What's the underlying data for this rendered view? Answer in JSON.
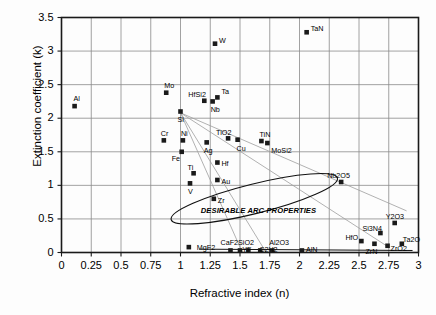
{
  "chart_data": {
    "type": "scatter",
    "title": "",
    "xlabel": "Refractive index (n)",
    "ylabel": "Extinction coefficient (k)",
    "xlim": [
      0,
      3
    ],
    "ylim": [
      0,
      3.5
    ],
    "xticks": [
      "0",
      "0.25",
      "0.5",
      "0.75",
      "1",
      "1.25",
      "1.5",
      "1.75",
      "2",
      "2.25",
      "2.5",
      "2.75",
      "3"
    ],
    "xtick_values": [
      0,
      0.25,
      0.5,
      0.75,
      1,
      1.25,
      1.5,
      1.75,
      2,
      2.25,
      2.5,
      2.75,
      3
    ],
    "yticks": [
      "0",
      "0.5",
      "1",
      "1.5",
      "2",
      "2.5",
      "3",
      "3.5"
    ],
    "ytick_values": [
      0,
      0.5,
      1,
      1.5,
      2,
      2.5,
      3,
      3.5
    ],
    "grid": true,
    "legend": null,
    "marker": "square",
    "marker_color": "#1a1a1a",
    "points": [
      {
        "label": "Al",
        "x": 0.11,
        "y": 2.18,
        "lx": -1,
        "ly": -11
      },
      {
        "label": "Mo",
        "x": 0.88,
        "y": 2.38,
        "lx": -2,
        "ly": -11
      },
      {
        "label": "Si",
        "x": 1.0,
        "y": 2.1,
        "lx": -3,
        "ly": 4
      },
      {
        "label": "HfSi2",
        "x": 1.2,
        "y": 2.26,
        "lx": -16,
        "ly": -10
      },
      {
        "label": "Ta",
        "x": 1.31,
        "y": 2.31,
        "lx": 4,
        "ly": -9
      },
      {
        "label": "Nb",
        "x": 1.27,
        "y": 2.25,
        "lx": -2,
        "ly": 5
      },
      {
        "label": "W",
        "x": 1.29,
        "y": 3.11,
        "lx": 4,
        "ly": -7
      },
      {
        "label": "TaN",
        "x": 2.06,
        "y": 3.28,
        "lx": 4,
        "ly": -7
      },
      {
        "label": "Cr",
        "x": 0.86,
        "y": 1.67,
        "lx": -3,
        "ly": -10
      },
      {
        "label": "Ni",
        "x": 1.02,
        "y": 1.67,
        "lx": -2,
        "ly": -10
      },
      {
        "label": "Ag",
        "x": 1.22,
        "y": 1.64,
        "lx": -3,
        "ly": 5
      },
      {
        "label": "TiO2",
        "x": 1.4,
        "y": 1.7,
        "lx": -12,
        "ly": -9
      },
      {
        "label": "Cu",
        "x": 1.48,
        "y": 1.68,
        "lx": -1,
        "ly": 5
      },
      {
        "label": "TiN",
        "x": 1.68,
        "y": 1.66,
        "lx": -2,
        "ly": -10
      },
      {
        "label": "MoSi2",
        "x": 1.73,
        "y": 1.63,
        "lx": 4,
        "ly": 4
      },
      {
        "label": "Fe",
        "x": 1.01,
        "y": 1.5,
        "lx": -10,
        "ly": 3
      },
      {
        "label": "Hf",
        "x": 1.31,
        "y": 1.34,
        "lx": 4,
        "ly": -3
      },
      {
        "label": "Ti",
        "x": 1.11,
        "y": 1.18,
        "lx": -6,
        "ly": -9
      },
      {
        "label": "Au",
        "x": 1.31,
        "y": 1.08,
        "lx": 4,
        "ly": -2
      },
      {
        "label": "V",
        "x": 1.08,
        "y": 1.03,
        "lx": -2,
        "ly": 5
      },
      {
        "label": "Zr",
        "x": 1.28,
        "y": 0.8,
        "lx": 4,
        "ly": -2
      },
      {
        "label": "Nb2O5",
        "x": 2.35,
        "y": 1.05,
        "lx": -14,
        "ly": -10
      },
      {
        "label": "Y2O3",
        "x": 2.8,
        "y": 0.44,
        "lx": -9,
        "ly": -10
      },
      {
        "label": "Si3N4",
        "x": 2.68,
        "y": 0.29,
        "lx": -18,
        "ly": -8
      },
      {
        "label": "HfO",
        "x": 2.52,
        "y": 0.17,
        "lx": -16,
        "ly": -7
      },
      {
        "label": "ZrN",
        "x": 2.63,
        "y": 0.13,
        "lx": -9,
        "ly": 4
      },
      {
        "label": "ZrO2",
        "x": 2.74,
        "y": 0.1,
        "lx": 3,
        "ly": -1
      },
      {
        "label": "Ta2O",
        "x": 2.86,
        "y": 0.13,
        "lx": 1,
        "ly": -8
      },
      {
        "label": "MgF2",
        "x": 1.07,
        "y": 0.08,
        "lx": 8,
        "ly": -3
      },
      {
        "label": "CaF2",
        "x": 1.42,
        "y": 0.03,
        "lx": -10,
        "ly": -11
      },
      {
        "label": "SiO2",
        "x": 1.5,
        "y": 0.03,
        "lx": -2,
        "ly": -11
      },
      {
        "label": "YF",
        "x": 1.57,
        "y": 0.03,
        "lx": -6,
        "ly": -4
      },
      {
        "label": "C2H2",
        "x": 1.67,
        "y": 0.03,
        "lx": -1,
        "ly": -4
      },
      {
        "label": "Al2O3",
        "x": 1.77,
        "y": 0.03,
        "lx": -3,
        "ly": -11
      },
      {
        "label": "AlN",
        "x": 2.02,
        "y": 0.03,
        "lx": 4,
        "ly": -4
      }
    ],
    "annotations": [
      {
        "text": "DESIRABLE ARC PROPERTIES",
        "x": 1.17,
        "y": 0.62
      }
    ],
    "shapes": {
      "ellipse": {
        "cx": 1.62,
        "cy": 0.8,
        "rx": 0.72,
        "ry": 0.22,
        "angle": -14
      },
      "fan_lines": [
        {
          "x1": 1.0,
          "y1": 2.08,
          "x2": 1.52,
          "y2": 0.0
        },
        {
          "x1": 1.0,
          "y1": 2.08,
          "x2": 1.72,
          "y2": 0.0
        },
        {
          "x1": 1.0,
          "y1": 2.08,
          "x2": 2.74,
          "y2": 0.09
        },
        {
          "x1": 1.0,
          "y1": 2.08,
          "x2": 2.9,
          "y2": 0.62
        }
      ],
      "baseline": {
        "x1": 1.16,
        "y1": 0.05,
        "x2": 2.95,
        "y2": 0.03
      }
    }
  },
  "axes": {
    "x_title": "Refractive index (n)",
    "y_title": "Extinction coefficient (k)"
  }
}
